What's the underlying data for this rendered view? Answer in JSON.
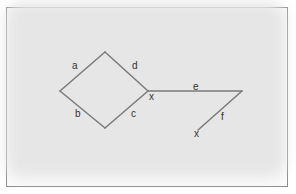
{
  "diagram": {
    "edge_color": "#7a7a7a",
    "text_color": "#333333",
    "nodes": [
      {
        "id": "top",
        "x": 105,
        "y": 52
      },
      {
        "id": "left",
        "x": 60,
        "y": 91
      },
      {
        "id": "bottom",
        "x": 105,
        "y": 128
      },
      {
        "id": "right",
        "x": 148,
        "y": 91
      },
      {
        "id": "far-right",
        "x": 242,
        "y": 91
      },
      {
        "id": "end",
        "x": 198,
        "y": 130
      }
    ],
    "edges": [
      {
        "label": "a",
        "from": "left",
        "to": "top"
      },
      {
        "label": "d",
        "from": "top",
        "to": "right"
      },
      {
        "label": "b",
        "from": "left",
        "to": "bottom"
      },
      {
        "label": "c",
        "from": "bottom",
        "to": "right"
      },
      {
        "label": "e",
        "from": "right",
        "to": "far-right"
      },
      {
        "label": "f",
        "from": "far-right",
        "to": "end"
      }
    ],
    "labels": {
      "a": "a",
      "b": "b",
      "c": "c",
      "d": "d",
      "e": "e",
      "f": "f",
      "x1": "x",
      "x2": "x"
    }
  }
}
